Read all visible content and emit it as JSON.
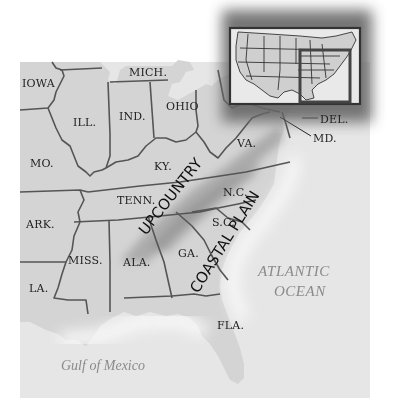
{
  "map": {
    "type": "regional-map",
    "subject": "Southeastern United States",
    "states": [
      {
        "id": "iowa",
        "label": "IOWA",
        "x": 22,
        "y": 87
      },
      {
        "id": "ill",
        "label": "ILL.",
        "x": 73,
        "y": 126
      },
      {
        "id": "ind",
        "label": "IND.",
        "x": 119,
        "y": 120
      },
      {
        "id": "ohio",
        "label": "OHIO",
        "x": 166,
        "y": 110
      },
      {
        "id": "mich",
        "label": "MICH.",
        "x": 129,
        "y": 76
      },
      {
        "id": "mo",
        "label": "MO.",
        "x": 30,
        "y": 167
      },
      {
        "id": "ky",
        "label": "KY.",
        "x": 154,
        "y": 170
      },
      {
        "id": "va",
        "label": "VA.",
        "x": 237,
        "y": 147
      },
      {
        "id": "tenn",
        "label": "TENN.",
        "x": 117,
        "y": 204
      },
      {
        "id": "nc",
        "label": "N.C.",
        "x": 223,
        "y": 196
      },
      {
        "id": "sc",
        "label": "S.C.",
        "x": 212,
        "y": 226
      },
      {
        "id": "ark",
        "label": "ARK.",
        "x": 26,
        "y": 228
      },
      {
        "id": "miss",
        "label": "MISS.",
        "x": 68,
        "y": 264
      },
      {
        "id": "ala",
        "label": "ALA.",
        "x": 123,
        "y": 266
      },
      {
        "id": "ga",
        "label": "GA.",
        "x": 178,
        "y": 257
      },
      {
        "id": "la",
        "label": "LA.",
        "x": 29,
        "y": 292
      },
      {
        "id": "fla",
        "label": "FLA.",
        "x": 217,
        "y": 329
      },
      {
        "id": "del",
        "label": "DEL.",
        "x": 320,
        "y": 123
      },
      {
        "id": "md",
        "label": "MD.",
        "x": 313,
        "y": 142
      }
    ],
    "regions": [
      {
        "id": "upcountry",
        "label": "UPCOUNTRY",
        "x": 146,
        "y": 236,
        "rotation": -52
      },
      {
        "id": "coastal-plain",
        "label": "COASTAL PLAIN",
        "x": 198,
        "y": 294,
        "rotation": -58
      }
    ],
    "water_bodies": [
      {
        "id": "atlantic",
        "line1": "ATLANTIC",
        "line2": "OCEAN"
      },
      {
        "id": "gulf",
        "label": "Gulf of Mexico"
      }
    ],
    "inset": {
      "description": "Locator map of contiguous United States with highlighted eastern region"
    },
    "colors": {
      "land": "#d4d4d4",
      "water": "#e6e6e6",
      "border": "#555555",
      "region_shade": "#a9a9a9",
      "label": "#222222",
      "water_label": "#8a8a8a"
    }
  }
}
